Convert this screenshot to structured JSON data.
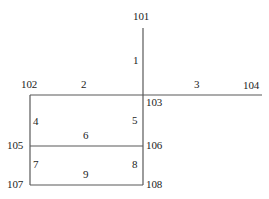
{
  "diagram": {
    "type": "line-schematic",
    "width": 269,
    "height": 199,
    "background_color": "#ffffff",
    "line_color": "#595959",
    "line_width": 1.2,
    "text_color": "#1c1c1c",
    "nodes": [
      {
        "id": "101",
        "label": "101",
        "x": 143,
        "y": 28,
        "label_x": 133,
        "label_y": 11
      },
      {
        "id": "102",
        "label": "102",
        "x": 30,
        "y": 95,
        "label_x": 21,
        "label_y": 79
      },
      {
        "id": "103",
        "label": "103",
        "x": 143,
        "y": 95,
        "label_x": 146,
        "label_y": 97
      },
      {
        "id": "104",
        "label": "104",
        "x": 262,
        "y": 95,
        "label_x": 243,
        "label_y": 80
      },
      {
        "id": "105",
        "label": "105",
        "x": 30,
        "y": 146,
        "label_x": 7,
        "label_y": 140
      },
      {
        "id": "106",
        "label": "106",
        "x": 143,
        "y": 146,
        "label_x": 146,
        "label_y": 140
      },
      {
        "id": "107",
        "label": "107",
        "x": 30,
        "y": 185,
        "label_x": 7,
        "label_y": 179
      },
      {
        "id": "108",
        "label": "108",
        "x": 143,
        "y": 185,
        "label_x": 146,
        "label_y": 179
      }
    ],
    "segments": [
      {
        "id": "1",
        "label": "1",
        "from": "101",
        "to": "103",
        "orientation": "vertical",
        "x1": 143,
        "y1": 28,
        "x2": 143,
        "y2": 95,
        "label_x": 133,
        "label_y": 55
      },
      {
        "id": "2",
        "label": "2",
        "from": "102",
        "to": "103",
        "orientation": "horizontal",
        "x1": 30,
        "y1": 95,
        "x2": 143,
        "y2": 95,
        "label_x": 81,
        "label_y": 79
      },
      {
        "id": "3",
        "label": "3",
        "from": "103",
        "to": "104",
        "orientation": "horizontal",
        "x1": 143,
        "y1": 95,
        "x2": 262,
        "y2": 95,
        "label_x": 194,
        "label_y": 79
      },
      {
        "id": "4",
        "label": "4",
        "from": "102",
        "to": "105",
        "orientation": "vertical",
        "x1": 30,
        "y1": 95,
        "x2": 30,
        "y2": 146,
        "label_x": 33,
        "label_y": 116
      },
      {
        "id": "5",
        "label": "5",
        "from": "103",
        "to": "106",
        "orientation": "vertical",
        "x1": 143,
        "y1": 95,
        "x2": 143,
        "y2": 146,
        "label_x": 132,
        "label_y": 115
      },
      {
        "id": "6",
        "label": "6",
        "from": "105",
        "to": "106",
        "orientation": "horizontal",
        "x1": 30,
        "y1": 146,
        "x2": 143,
        "y2": 146,
        "label_x": 83,
        "label_y": 130
      },
      {
        "id": "7",
        "label": "7",
        "from": "105",
        "to": "107",
        "orientation": "vertical",
        "x1": 30,
        "y1": 146,
        "x2": 30,
        "y2": 185,
        "label_x": 33,
        "label_y": 159
      },
      {
        "id": "8",
        "label": "8",
        "from": "106",
        "to": "108",
        "orientation": "vertical",
        "x1": 143,
        "y1": 146,
        "x2": 143,
        "y2": 185,
        "label_x": 132,
        "label_y": 159
      },
      {
        "id": "9",
        "label": "9",
        "from": "107",
        "to": "108",
        "orientation": "horizontal",
        "x1": 30,
        "y1": 185,
        "x2": 143,
        "y2": 185,
        "label_x": 83,
        "label_y": 169
      }
    ]
  }
}
